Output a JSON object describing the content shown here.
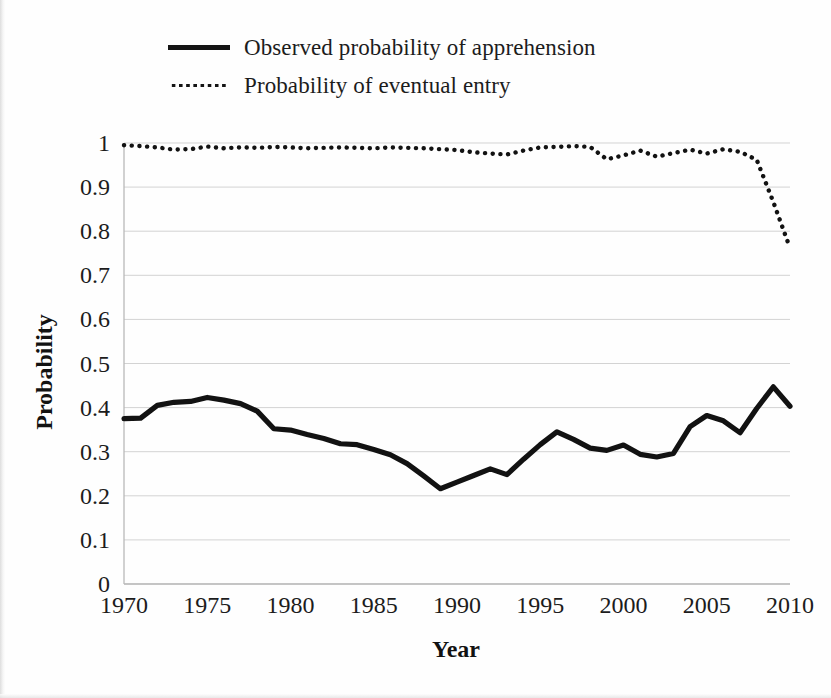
{
  "legend": {
    "position": "top-left",
    "entries": [
      {
        "label": "Observed probability of apprehension",
        "style": "solid",
        "key_name": "legend-key-solid"
      },
      {
        "label": "Probability of eventual entry",
        "style": "dotted",
        "key_name": "legend-key-dotted"
      }
    ]
  },
  "axes": {
    "x_title": "Year",
    "y_title": "Probability",
    "x_ticks": [
      "1970",
      "1975",
      "1980",
      "1985",
      "1990",
      "1995",
      "2000",
      "2005",
      "2010"
    ],
    "y_ticks": [
      "0",
      "0.1",
      "0.2",
      "0.3",
      "0.4",
      "0.5",
      "0.6",
      "0.7",
      "0.8",
      "0.9",
      "1"
    ]
  },
  "colors": {
    "line": "#121212",
    "grid": "#d3d3d3",
    "background": "#ffffff"
  },
  "chart_data": {
    "type": "line",
    "title": "",
    "xlabel": "Year",
    "ylabel": "Probability",
    "xlim": [
      1970,
      2010
    ],
    "ylim": [
      0,
      1
    ],
    "xticks": [
      1970,
      1975,
      1980,
      1985,
      1990,
      1995,
      2000,
      2005,
      2010
    ],
    "yticks": [
      0,
      0.1,
      0.2,
      0.3,
      0.4,
      0.5,
      0.6,
      0.7,
      0.8,
      0.9,
      1
    ],
    "grid": "horizontal",
    "legend_position": "above-plot-left",
    "x": [
      1970,
      1971,
      1972,
      1973,
      1974,
      1975,
      1976,
      1977,
      1978,
      1979,
      1980,
      1981,
      1982,
      1983,
      1984,
      1985,
      1986,
      1987,
      1988,
      1989,
      1990,
      1991,
      1992,
      1993,
      1994,
      1995,
      1996,
      1997,
      1998,
      1999,
      2000,
      2001,
      2002,
      2003,
      2004,
      2005,
      2006,
      2007,
      2008,
      2009,
      2010
    ],
    "series": [
      {
        "name": "Observed probability of apprehension",
        "style": "solid",
        "values": [
          0.375,
          0.376,
          0.405,
          0.412,
          0.414,
          0.423,
          0.417,
          0.409,
          0.392,
          0.352,
          0.349,
          0.339,
          0.33,
          0.318,
          0.316,
          0.305,
          0.293,
          0.273,
          0.245,
          0.216,
          0.231,
          0.246,
          0.261,
          0.248,
          0.283,
          0.316,
          0.345,
          0.328,
          0.308,
          0.303,
          0.315,
          0.294,
          0.288,
          0.296,
          0.357,
          0.382,
          0.37,
          0.343,
          0.398,
          0.447,
          0.403
        ]
      },
      {
        "name": "Probability of eventual entry",
        "style": "dotted",
        "values": [
          0.995,
          0.993,
          0.99,
          0.985,
          0.986,
          0.992,
          0.988,
          0.99,
          0.989,
          0.991,
          0.99,
          0.988,
          0.989,
          0.99,
          0.989,
          0.988,
          0.99,
          0.989,
          0.988,
          0.986,
          0.984,
          0.979,
          0.976,
          0.974,
          0.983,
          0.99,
          0.991,
          0.993,
          0.991,
          0.963,
          0.972,
          0.983,
          0.969,
          0.977,
          0.985,
          0.976,
          0.986,
          0.98,
          0.962,
          0.866,
          0.762
        ]
      }
    ]
  }
}
